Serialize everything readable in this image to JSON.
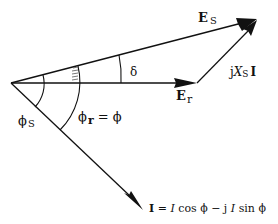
{
  "diagram": {
    "type": "phasor-diagram",
    "colors": {
      "ink": "#111111",
      "background": "#ffffff"
    },
    "labels": {
      "es_main": "E",
      "es_sub": "S",
      "er_main": "E",
      "er_sub": "r",
      "delta": "δ",
      "jxsi_j": "j",
      "jxsi_x": "X",
      "jxsi_sub": "S",
      "jxsi_i": "I",
      "phi_s_main": "ϕ",
      "phi_s_sub": "S",
      "phi_r_main": "ϕ",
      "phi_r_sub": "r",
      "phi_r_eq": " = ϕ",
      "current_lhs": "I",
      "current_eq": " = ",
      "current_I1": "I",
      "current_cos": " cos ϕ",
      "current_minus_j": " − j ",
      "current_I2": "I",
      "current_sin": " sin ϕ"
    },
    "phasors": [
      {
        "name": "E_s",
        "description": "sending-end voltage"
      },
      {
        "name": "E_r",
        "description": "receiving-end voltage"
      },
      {
        "name": "jX_s I",
        "description": "reactance voltage drop"
      },
      {
        "name": "I",
        "description": "current"
      }
    ],
    "angles": [
      "δ",
      "ϕs",
      "ϕr = ϕ"
    ]
  }
}
